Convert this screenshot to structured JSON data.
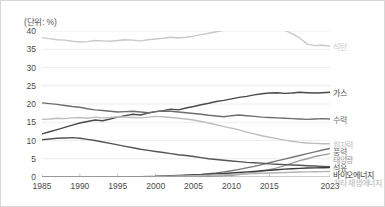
{
  "unit_label": "(단위: %)",
  "chart_data": {
    "type": "line",
    "title": "",
    "subtitle": "",
    "xlabel": "",
    "ylabel": "",
    "unit": "(단위: %)",
    "xlim": [
      1985,
      2023
    ],
    "ylim": [
      0,
      40
    ],
    "ytick_step": 5,
    "grid": true,
    "legend_position": "right-edge-labels",
    "xticks": [
      "1985",
      "1990",
      "1995",
      "2000",
      "2005",
      "2010",
      "2015",
      "2023"
    ],
    "xtick_values": [
      1985,
      1990,
      1995,
      2000,
      2005,
      2010,
      2015,
      2023
    ],
    "yticks": [
      "0",
      "5",
      "10",
      "15",
      "20",
      "25",
      "30",
      "35",
      "40"
    ],
    "ytick_values": [
      0,
      5,
      10,
      15,
      20,
      25,
      30,
      35,
      40
    ],
    "x": [
      1985,
      1986,
      1987,
      1988,
      1989,
      1990,
      1991,
      1992,
      1993,
      1994,
      1995,
      1996,
      1997,
      1998,
      1999,
      2000,
      2001,
      2002,
      2003,
      2004,
      2005,
      2006,
      2007,
      2008,
      2009,
      2010,
      2011,
      2012,
      2013,
      2014,
      2015,
      2016,
      2017,
      2018,
      2019,
      2020,
      2021,
      2022,
      2023
    ],
    "series": [
      {
        "name": "석탄",
        "label": "석탄",
        "color": "#c9c9c9",
        "end_value": 35.9,
        "values": [
          38.2,
          37.9,
          37.6,
          37.5,
          37.2,
          37.0,
          37.1,
          37.4,
          37.3,
          37.2,
          37.4,
          37.6,
          37.5,
          37.3,
          37.6,
          37.8,
          38.0,
          38.3,
          38.1,
          38.3,
          38.6,
          39.0,
          39.4,
          39.8,
          40.2,
          40.5,
          40.8,
          40.6,
          40.9,
          40.8,
          40.5,
          40.4,
          40.2,
          39.3,
          38.1,
          36.4,
          36.0,
          36.1,
          35.9
        ]
      },
      {
        "name": "가스",
        "label": "가스",
        "color": "#4a4a4a",
        "end_value": 23.2,
        "values": [
          11.8,
          12.4,
          13.0,
          13.6,
          14.2,
          14.8,
          15.2,
          15.6,
          15.4,
          15.9,
          16.4,
          16.8,
          17.2,
          17.0,
          17.5,
          17.9,
          18.2,
          18.6,
          18.4,
          18.9,
          19.3,
          19.8,
          20.2,
          20.7,
          21.0,
          21.4,
          21.8,
          22.1,
          22.5,
          22.8,
          23.0,
          23.1,
          22.9,
          23.0,
          23.2,
          23.1,
          23.0,
          23.1,
          23.2
        ]
      },
      {
        "name": "수력",
        "label": "수력",
        "color": "#6e6e6e",
        "end_value": 15.9,
        "values": [
          20.3,
          20.1,
          19.9,
          19.6,
          19.3,
          19.1,
          18.7,
          18.4,
          18.2,
          18.0,
          17.8,
          17.9,
          18.0,
          17.8,
          17.6,
          17.9,
          18.1,
          18.0,
          17.8,
          17.6,
          17.4,
          17.2,
          16.9,
          16.7,
          16.5,
          16.8,
          17.0,
          16.8,
          16.6,
          16.4,
          16.3,
          16.2,
          16.1,
          16.0,
          15.9,
          15.8,
          15.9,
          16.0,
          15.9
        ]
      },
      {
        "name": "원자력",
        "label": "원자력",
        "color": "#bdbdbd",
        "end_value": 9.1,
        "values": [
          15.8,
          15.9,
          16.1,
          16.0,
          16.2,
          16.3,
          16.1,
          16.4,
          16.2,
          16.3,
          16.5,
          16.4,
          16.3,
          16.2,
          16.4,
          16.6,
          16.5,
          16.3,
          16.1,
          15.9,
          15.6,
          15.2,
          14.8,
          14.3,
          13.8,
          13.4,
          12.9,
          12.3,
          11.8,
          11.3,
          10.9,
          10.5,
          10.1,
          9.8,
          9.5,
          9.3,
          9.2,
          9.1,
          9.1
        ]
      },
      {
        "name": "풍력",
        "label": "풍력",
        "color": "#777777",
        "end_value": 7.8,
        "values": [
          0.0,
          0.0,
          0.0,
          0.0,
          0.0,
          0.0,
          0.0,
          0.0,
          0.0,
          0.0,
          0.05,
          0.06,
          0.08,
          0.1,
          0.12,
          0.15,
          0.2,
          0.25,
          0.32,
          0.42,
          0.55,
          0.7,
          0.9,
          1.1,
          1.4,
          1.7,
          2.1,
          2.5,
          2.9,
          3.4,
          3.9,
          4.4,
          4.9,
          5.4,
          5.9,
          6.4,
          6.9,
          7.4,
          7.8
        ]
      },
      {
        "name": "태양광",
        "label": "태양광",
        "color": "#9a9a9a",
        "end_value": 6.4,
        "values": [
          0.0,
          0.0,
          0.0,
          0.0,
          0.0,
          0.0,
          0.0,
          0.0,
          0.0,
          0.0,
          0.0,
          0.0,
          0.0,
          0.0,
          0.01,
          0.01,
          0.02,
          0.03,
          0.04,
          0.06,
          0.08,
          0.12,
          0.18,
          0.25,
          0.35,
          0.5,
          0.7,
          0.95,
          1.25,
          1.6,
          2.0,
          2.5,
          3.1,
          3.8,
          4.5,
          5.0,
          5.6,
          6.0,
          6.4
        ]
      },
      {
        "name": "석유",
        "label": "석유",
        "color": "#555555",
        "end_value": 2.8,
        "values": [
          10.2,
          10.4,
          10.6,
          10.7,
          10.8,
          10.6,
          10.3,
          10.0,
          9.6,
          9.2,
          8.8,
          8.4,
          8.0,
          7.6,
          7.3,
          7.0,
          6.7,
          6.4,
          6.1,
          5.9,
          5.6,
          5.3,
          5.0,
          4.8,
          4.6,
          4.4,
          4.2,
          4.0,
          3.9,
          3.8,
          3.6,
          3.5,
          3.4,
          3.3,
          3.2,
          3.1,
          3.0,
          2.9,
          2.8
        ]
      },
      {
        "name": "바이오에너지",
        "label": "바이오에너지",
        "color": "#3a3a3a",
        "end_value": 2.6,
        "values": [
          null,
          null,
          null,
          null,
          null,
          null,
          null,
          null,
          null,
          null,
          null,
          null,
          null,
          null,
          null,
          0.25,
          0.3,
          0.35,
          0.4,
          0.48,
          0.55,
          0.65,
          0.75,
          0.85,
          0.95,
          1.1,
          1.25,
          1.4,
          1.55,
          1.7,
          1.85,
          2.0,
          2.15,
          2.25,
          2.35,
          2.45,
          2.5,
          2.55,
          2.6
        ]
      },
      {
        "name": "기타 재생에너지",
        "label": "기타 재생에너지",
        "color": "#b5b5b5",
        "end_value": 1.5,
        "values": [
          null,
          null,
          null,
          null,
          null,
          null,
          null,
          null,
          null,
          null,
          null,
          null,
          null,
          null,
          null,
          0.2,
          0.22,
          0.25,
          0.28,
          0.32,
          0.36,
          0.42,
          0.48,
          0.55,
          0.62,
          0.7,
          0.78,
          0.86,
          0.95,
          1.02,
          1.1,
          1.18,
          1.25,
          1.3,
          1.36,
          1.4,
          1.44,
          1.47,
          1.5
        ]
      }
    ]
  },
  "series_label_positions": [
    {
      "label": "석탄",
      "value": 35.9
    },
    {
      "label": "가스",
      "value": 23.2
    },
    {
      "label": "수력",
      "value": 15.9
    },
    {
      "label": "원자력",
      "value": 9.1
    },
    {
      "label": "풍력",
      "value": 7.8
    },
    {
      "label": "태양광",
      "value": 6.4
    },
    {
      "label": "석유",
      "value": 2.8
    },
    {
      "label": "바이오에너지",
      "value": 2.6
    },
    {
      "label": "기타 재생에너지",
      "value": 1.5
    }
  ]
}
